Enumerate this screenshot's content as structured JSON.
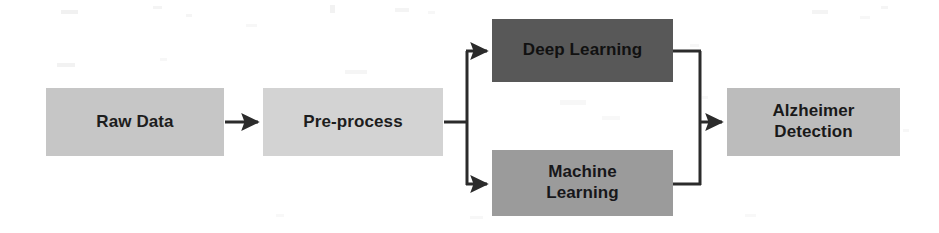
{
  "diagram": {
    "type": "flowchart",
    "orientation": "left-to-right",
    "background_color": "#ffffff",
    "connector_color": "#2b2b2b",
    "nodes": [
      {
        "id": "raw-data",
        "label": "Raw Data",
        "fill": "#c6c6c6",
        "text_color": "#1d1d1d",
        "stage": 1
      },
      {
        "id": "pre-process",
        "label": "Pre-process",
        "fill": "#d3d3d3",
        "text_color": "#1d1d1d",
        "stage": 2
      },
      {
        "id": "deep-learning",
        "label": "Deep Learning",
        "fill": "#585858",
        "text_color": "#111111",
        "stage": 3
      },
      {
        "id": "machine-learning",
        "label": "Machine\nLearning",
        "fill": "#9b9b9b",
        "text_color": "#17171a",
        "stage": 3
      },
      {
        "id": "alzheimer-detection",
        "label": "Alzheimer\nDetection",
        "fill": "#bcbcbc",
        "text_color": "#191919",
        "stage": 4
      }
    ],
    "edges": [
      {
        "id": "raw-data-to-pre-process",
        "from": "raw-data",
        "to": "pre-process",
        "arrow": true
      },
      {
        "id": "pre-process-to-deep-learning",
        "from": "pre-process",
        "to": "deep-learning",
        "arrow": true
      },
      {
        "id": "pre-process-to-machine-learning",
        "from": "pre-process",
        "to": "machine-learning",
        "arrow": true
      },
      {
        "id": "deep-learning-to-alzheimer-detection",
        "from": "deep-learning",
        "to": "alzheimer-detection",
        "arrow": true
      },
      {
        "id": "machine-learning-to-alzheimer-detection",
        "from": "machine-learning",
        "to": "alzheimer-detection",
        "arrow": true
      }
    ]
  }
}
